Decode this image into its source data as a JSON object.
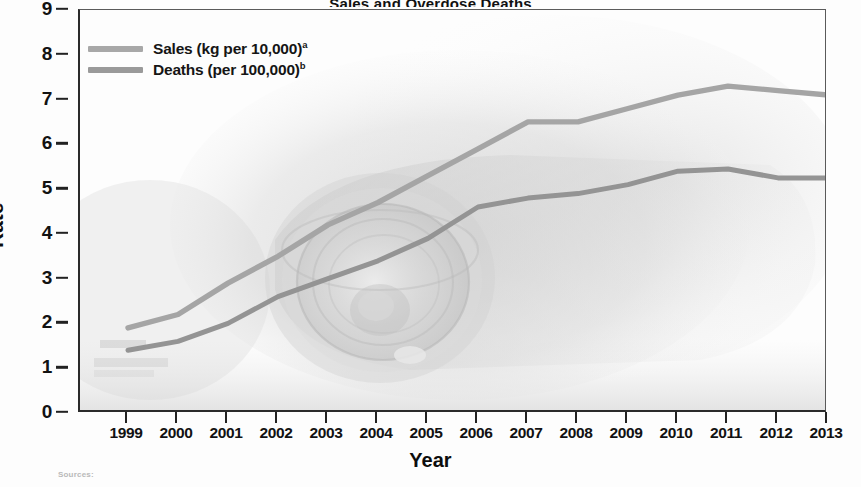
{
  "figure": {
    "title_sliver": "Sales and Overdose Deaths",
    "source_note": "Sources:"
  },
  "axes": {
    "y_title": "Rate",
    "x_title": "Year",
    "y_ticks": [
      0,
      1,
      2,
      3,
      4,
      5,
      6,
      7,
      8,
      9
    ],
    "x_ticks": [
      "1999",
      "2000",
      "2001",
      "2002",
      "2003",
      "2004",
      "2005",
      "2006",
      "2007",
      "2008",
      "2009",
      "2010",
      "2011",
      "2012",
      "2013"
    ]
  },
  "legend": {
    "position": "top-left",
    "items": [
      {
        "label": "Sales (kg per 10,000)",
        "marker": "a",
        "color": "#a8a8a8",
        "name": "sales"
      },
      {
        "label": "Deaths (per 100,000)",
        "marker": "b",
        "color": "#9a9a9a",
        "name": "deaths"
      }
    ]
  },
  "colors": {
    "sales_line": "#a5a5a5",
    "deaths_line": "#949494",
    "axis": "#222222",
    "text": "#121212",
    "background": "#fdfdfd"
  },
  "chart_data": {
    "type": "line",
    "title": "Sales and Overdose Deaths",
    "xlabel": "Year",
    "ylabel": "Rate",
    "xlim": [
      1999,
      2013
    ],
    "ylim": [
      0,
      9
    ],
    "grid": false,
    "legend_position": "top-left",
    "x": [
      1999,
      2000,
      2001,
      2002,
      2003,
      2004,
      2005,
      2006,
      2007,
      2008,
      2009,
      2010,
      2011,
      2012,
      2013
    ],
    "series": [
      {
        "name": "Sales (kg per 10,000)",
        "footnote": "a",
        "color": "#a5a5a5",
        "values": [
          1.9,
          2.2,
          2.9,
          3.5,
          4.2,
          4.7,
          5.3,
          5.9,
          6.5,
          6.5,
          6.8,
          7.1,
          7.3,
          7.2,
          7.1
        ]
      },
      {
        "name": "Deaths (per 100,000)",
        "footnote": "b",
        "color": "#949494",
        "values": [
          1.4,
          1.6,
          2.0,
          2.6,
          3.0,
          3.4,
          3.9,
          4.6,
          4.8,
          4.9,
          5.1,
          5.4,
          5.45,
          5.25,
          5.25
        ]
      }
    ]
  }
}
